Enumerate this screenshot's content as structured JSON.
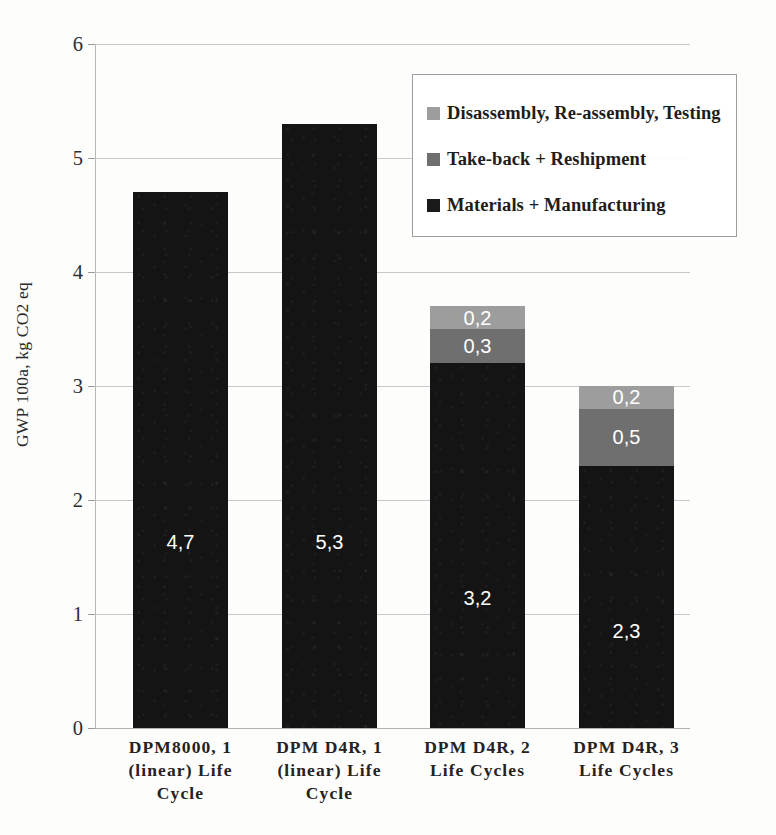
{
  "chart_data": {
    "type": "bar",
    "subtype": "stacked-bar",
    "title": "",
    "xlabel": "",
    "ylabel": "GWP 100a, kg CO2 eq",
    "ylim": [
      0,
      6
    ],
    "ytick_labels": [
      "0",
      "1",
      "2",
      "3",
      "4",
      "5",
      "6"
    ],
    "ytick_values": [
      0,
      1,
      2,
      3,
      4,
      5,
      6
    ],
    "grid": true,
    "decimal_separator": ",",
    "legend_position": "inside-top-right",
    "categories": [
      "DPM 8000, 1 (linear) Life Cycle",
      "DPM D4R, 1 (linear) Life Cycle",
      "DPM D4R, 2 Life Cycles",
      "DPM D4R, 3 Life Cycles"
    ],
    "category_label_lines": [
      [
        "DPM8000, 1",
        "(linear) Life",
        "Cycle"
      ],
      [
        "DPM D4R, 1",
        "(linear) Life",
        "Cycle"
      ],
      [
        "DPM D4R, 2",
        "Life Cycles"
      ],
      [
        "DPM D4R, 3",
        "Life Cycles"
      ]
    ],
    "series": [
      {
        "name": "Materials + Manufacturing",
        "color": "#141414",
        "values": [
          4.7,
          5.3,
          3.2,
          2.3
        ],
        "labels": [
          "4,7",
          "5,3",
          "3,2",
          "2,3"
        ]
      },
      {
        "name": "Take-back + Reshipment",
        "color": "#6f6f6f",
        "values": [
          0,
          0,
          0.3,
          0.5
        ],
        "labels": [
          "",
          "",
          "0,3",
          "0,5"
        ]
      },
      {
        "name": "Disassembly, Re-assembly, Testing",
        "color": "#9d9d9d",
        "values": [
          0,
          0,
          0.2,
          0.2
        ],
        "labels": [
          "",
          "",
          "0,2",
          "0,2"
        ]
      }
    ],
    "totals": [
      4.7,
      5.3,
      3.7,
      3.0
    ]
  },
  "legend": {
    "entries": [
      {
        "label": "Disassembly, Re-assembly, Testing",
        "color": "#9d9d9d"
      },
      {
        "label": "Take-back + Reshipment",
        "color": "#6f6f6f"
      },
      {
        "label": "Materials + Manufacturing",
        "color": "#1a1a1a"
      }
    ]
  },
  "axis": {
    "y_title": "GWP 100a, kg CO2 eq",
    "y_ticks": [
      "6",
      "5",
      "4",
      "3",
      "2",
      "1",
      "0"
    ]
  }
}
